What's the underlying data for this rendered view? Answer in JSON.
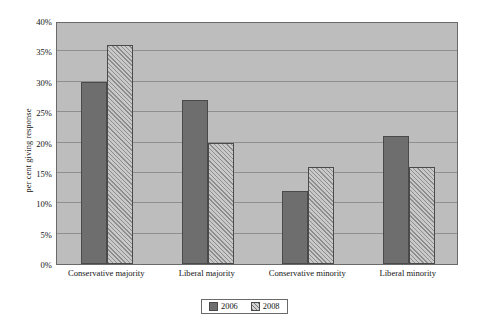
{
  "chart_data": {
    "type": "bar",
    "title": "",
    "xlabel": "",
    "ylabel": "per cent giving response",
    "ylim": [
      0,
      40
    ],
    "ytick_labels": [
      "0%",
      "5%",
      "10%",
      "15%",
      "20%",
      "25%",
      "30%",
      "35%",
      "40%"
    ],
    "ytick_values": [
      0,
      5,
      10,
      15,
      20,
      25,
      30,
      35,
      40
    ],
    "grid": true,
    "legend_position": "bottom-center",
    "categories": [
      "Conservative majority",
      "Liberal majority",
      "Conservative minority",
      "Liberal minority"
    ],
    "series": [
      {
        "name": "2006",
        "values": [
          30,
          27,
          12,
          21
        ],
        "color": "#6e6e6e",
        "fill": "solid"
      },
      {
        "name": "2008",
        "values": [
          36,
          20,
          16,
          16
        ],
        "color": "#c9c9c9",
        "fill": "diagonal-hatch"
      }
    ]
  },
  "legend": {
    "entries": [
      {
        "label": "2006"
      },
      {
        "label": "2008"
      }
    ]
  },
  "colors": {
    "plot_background": "#bdbdbd",
    "gridline": "#8f8f8f",
    "axis_border": "#6a6a6a",
    "series_2006": "#6e6e6e",
    "series_2008": "#c9c9c9",
    "text": "#141414"
  }
}
